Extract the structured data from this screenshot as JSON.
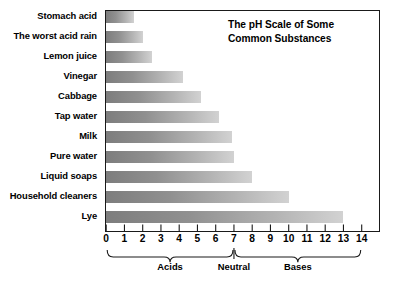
{
  "chart_data": {
    "type": "bar",
    "orientation": "horizontal",
    "title": "The pH Scale of Some Common Substances",
    "title_lines": [
      "The pH Scale of Some",
      "Common Substances"
    ],
    "xlabel": "",
    "ylabel": "",
    "xlim": [
      0,
      14
    ],
    "grid": false,
    "legend": false,
    "categories": [
      "Stomach acid",
      "The worst acid rain",
      "Lemon juice",
      "Vinegar",
      "Cabbage",
      "Tap water",
      "Milk",
      "Pure water",
      "Liquid soaps",
      "Household cleaners",
      "Lye"
    ],
    "values": [
      1.5,
      2.0,
      2.5,
      4.2,
      5.2,
      6.2,
      6.9,
      7.0,
      8.0,
      10.0,
      13.0
    ],
    "tick_labels": [
      "0",
      "1",
      "2",
      "3",
      "4",
      "5",
      "6",
      "7",
      "8",
      "9",
      "10",
      "11",
      "12",
      "13",
      "14"
    ],
    "annotations": [
      {
        "label": "Acids",
        "from": 0,
        "to": 7,
        "center": 3.5
      },
      {
        "label": "Neutral",
        "from": 7,
        "to": 7,
        "center": 7
      },
      {
        "label": "Bases",
        "from": 7,
        "to": 14,
        "center": 10.5
      }
    ],
    "colors": {
      "bar_gradient_start": "#7d7d7d",
      "bar_gradient_end": "#d2d2d2",
      "frame": "#1a1a1a",
      "text": "#000000",
      "background": "#ffffff"
    }
  }
}
